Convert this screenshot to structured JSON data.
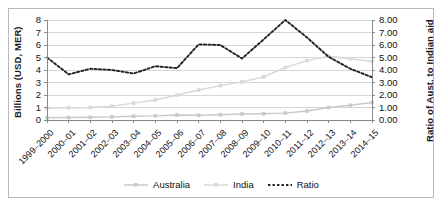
{
  "chart_data": {
    "type": "line",
    "title": "",
    "xlabel": "",
    "ylabel": "Billions (USD, MER)",
    "y2label": "Ratio of Aust. to Indian aid",
    "categories": [
      "1999–2000",
      "2000–01",
      "2001–02",
      "2002–03",
      "2003–04",
      "2004–05",
      "2005–06",
      "2006–07",
      "2007–08",
      "2008–09",
      "2009–10",
      "2010–11",
      "2011–12",
      "2012–13",
      "2013–14",
      "2014–15"
    ],
    "ylim": [
      0,
      8
    ],
    "y2lim": [
      0,
      8
    ],
    "yticks": [
      "0",
      "1",
      "2",
      "3",
      "4",
      "5",
      "6",
      "7",
      "8"
    ],
    "y2ticks": [
      "0.00",
      "1.00",
      "2.00",
      "3.00",
      "4.00",
      "5.00",
      "6.00",
      "7.00",
      "8.00"
    ],
    "grid": true,
    "legend_position": "bottom",
    "series": [
      {
        "name": "Australia",
        "axis": "left",
        "style": "solid",
        "color": "#c9c9c9",
        "values": [
          0.18,
          0.2,
          0.22,
          0.25,
          0.3,
          0.33,
          0.4,
          0.38,
          0.42,
          0.48,
          0.5,
          0.55,
          0.72,
          1.0,
          1.18,
          1.4
        ]
      },
      {
        "name": "India",
        "axis": "left",
        "style": "solid",
        "color": "#d8d8d8",
        "values": [
          0.95,
          0.98,
          1.0,
          1.1,
          1.35,
          1.6,
          2.0,
          2.4,
          2.75,
          3.05,
          3.45,
          4.2,
          4.75,
          5.1,
          4.9,
          4.7
        ]
      },
      {
        "name": "Ratio",
        "axis": "right",
        "style": "dotted",
        "color": "#222222",
        "values": [
          5.0,
          3.65,
          4.1,
          4.0,
          3.72,
          4.3,
          4.15,
          6.05,
          6.0,
          4.92,
          6.45,
          8.0,
          6.6,
          5.05,
          4.1,
          3.42
        ]
      }
    ]
  }
}
